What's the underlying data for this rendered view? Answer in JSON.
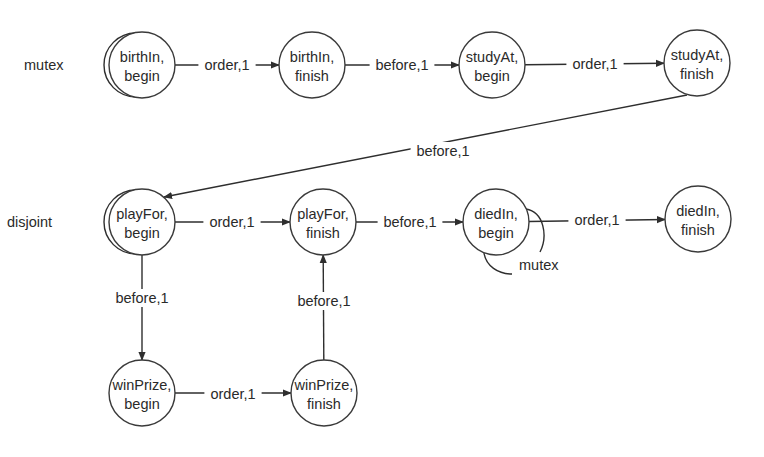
{
  "diagram": {
    "title": "",
    "colors": {
      "stroke": "#2e2e2e",
      "text": "#2a2a2a",
      "background": "#ffffff"
    },
    "node_radius": 33,
    "nodes": [
      {
        "id": "birthIn_begin",
        "line1": "birthIn,",
        "line2": "begin",
        "cx": 142,
        "cy": 65
      },
      {
        "id": "birthIn_finish",
        "line1": "birthIn,",
        "line2": "finish",
        "cx": 312,
        "cy": 65
      },
      {
        "id": "studyAt_begin",
        "line1": "studyAt,",
        "line2": "begin",
        "cx": 492,
        "cy": 65
      },
      {
        "id": "studyAt_finish",
        "line1": "studyAt,",
        "line2": "finish",
        "cx": 697,
        "cy": 63
      },
      {
        "id": "playFor_begin",
        "line1": "playFor,",
        "line2": "begin",
        "cx": 142,
        "cy": 222
      },
      {
        "id": "playFor_finish",
        "line1": "playFor,",
        "line2": "finish",
        "cx": 323,
        "cy": 222
      },
      {
        "id": "diedIn_begin",
        "line1": "diedIn,",
        "line2": "begin",
        "cx": 496,
        "cy": 222
      },
      {
        "id": "diedIn_finish",
        "line1": "diedIn,",
        "line2": "finish",
        "cx": 698,
        "cy": 219
      },
      {
        "id": "winPrize_begin",
        "line1": "winPrize,",
        "line2": "begin",
        "cx": 142,
        "cy": 393
      },
      {
        "id": "winPrize_finish",
        "line1": "winPrize,",
        "line2": "finish",
        "cx": 324,
        "cy": 393
      }
    ],
    "edges": [
      {
        "from": "birthIn_begin",
        "to": "birthIn_finish",
        "label": "order,1",
        "lx": 227,
        "ly": 65
      },
      {
        "from": "birthIn_finish",
        "to": "studyAt_begin",
        "label": "before,1",
        "lx": 402,
        "ly": 65
      },
      {
        "from": "studyAt_begin",
        "to": "studyAt_finish",
        "label": "order,1",
        "lx": 595,
        "ly": 64
      },
      {
        "from": "studyAt_finish",
        "to": "playFor_begin",
        "label": "before,1",
        "lx": 443,
        "ly": 151,
        "curve": "diag"
      },
      {
        "from": "playFor_begin",
        "to": "playFor_finish",
        "label": "order,1",
        "lx": 232,
        "ly": 222
      },
      {
        "from": "playFor_finish",
        "to": "diedIn_begin",
        "label": "before,1",
        "lx": 410,
        "ly": 222
      },
      {
        "from": "diedIn_begin",
        "to": "diedIn_finish",
        "label": "order,1",
        "lx": 597,
        "ly": 220
      },
      {
        "from": "playFor_begin",
        "to": "winPrize_begin",
        "label": "before,1",
        "lx": 142,
        "ly": 298
      },
      {
        "from": "winPrize_begin",
        "to": "winPrize_finish",
        "label": "order,1",
        "lx": 233,
        "ly": 394
      },
      {
        "from": "winPrize_finish",
        "to": "playFor_finish",
        "label": "before,1",
        "lx": 324,
        "ly": 301
      }
    ],
    "self_loops": [
      {
        "node": "birthIn_begin",
        "label": "mutex",
        "side": "left",
        "lx": 24,
        "ly": 70
      },
      {
        "node": "playFor_begin",
        "label": "disjoint",
        "side": "left",
        "lx": 7,
        "ly": 227
      },
      {
        "node": "diedIn_begin",
        "label": "mutex",
        "side": "bottom-right",
        "lx": 519,
        "ly": 270
      }
    ]
  }
}
